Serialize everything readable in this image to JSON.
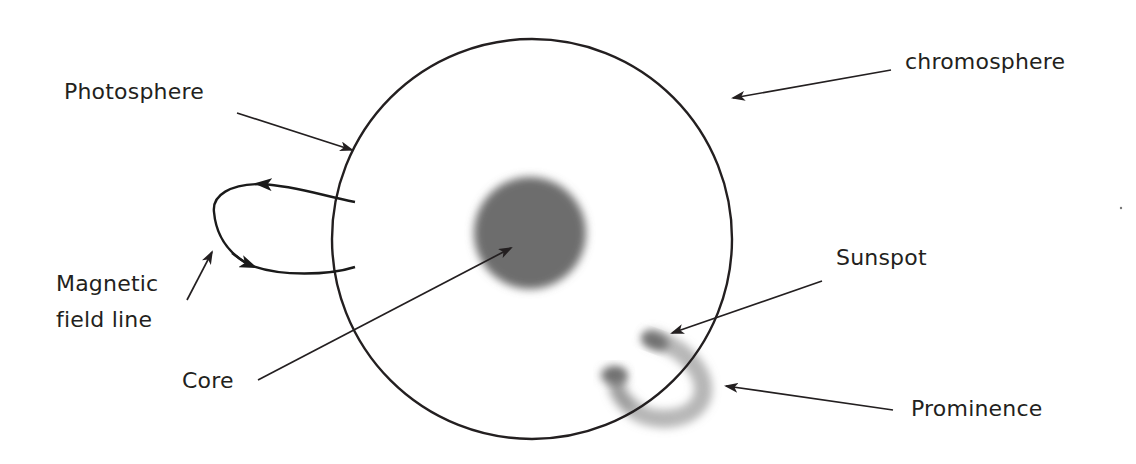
{
  "diagram": {
    "colors": {
      "background": "#ffffff",
      "ink": "#231f20",
      "core_fill": "#6d6d6d",
      "feature_fill": "#7a7a7a"
    },
    "labels": {
      "chromosphere": "chromosphere",
      "photosphere": "Photosphere",
      "magnetic_line1": "Magnetic",
      "magnetic_line2": "field line",
      "core": "Core",
      "sunspot": "Sunspot",
      "prominence": "Prominence"
    },
    "shapes": {
      "sun": {
        "cx": 532,
        "cy": 239,
        "r": 200
      },
      "core": {
        "cx": 530,
        "cy": 233,
        "r": 57
      }
    },
    "annotations": [
      {
        "target": "chromosphere",
        "label_pos": [
          905,
          69
        ],
        "arrow_from": [
          891,
          70
        ],
        "arrow_to": [
          731,
          98
        ]
      },
      {
        "target": "photosphere",
        "label_pos": [
          64,
          99
        ],
        "arrow_from": [
          237,
          113
        ],
        "arrow_to": [
          354,
          151
        ]
      },
      {
        "target": "magnetic field line",
        "label_pos": [
          56,
          291
        ],
        "arrow_from": [
          187,
          300
        ],
        "arrow_to": [
          213,
          250
        ]
      },
      {
        "target": "core",
        "label_pos": [
          182,
          388
        ],
        "arrow_from": [
          258,
          380
        ],
        "arrow_to": [
          513,
          247
        ]
      },
      {
        "target": "sunspot",
        "label_pos": [
          856,
          265
        ],
        "arrow_from": [
          822,
          281
        ],
        "arrow_to": [
          670,
          334
        ]
      },
      {
        "target": "prominence",
        "label_pos": [
          911,
          416
        ],
        "arrow_from": [
          893,
          410
        ],
        "arrow_to": [
          724,
          386
        ]
      }
    ]
  }
}
